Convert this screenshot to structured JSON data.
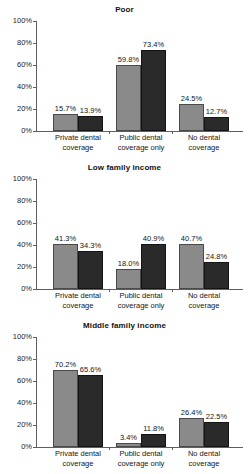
{
  "figure": {
    "bar_colors": {
      "light": "#8a8a8a",
      "dark": "#2a2a2a"
    },
    "axis_color": "#5f5f5f"
  },
  "y_axis": {
    "ticks": [
      "100%",
      "80%",
      "60%",
      "40%",
      "20%",
      "0%"
    ],
    "values": [
      100,
      80,
      60,
      40,
      20,
      0
    ],
    "min": 0,
    "max": 100
  },
  "categories": [
    "Private dental\ncoverage",
    "Public dental\ncoverage only",
    "No dental\ncoverage"
  ],
  "panels": [
    {
      "title": "Poor",
      "labels": [
        "15.7%",
        "13.9%",
        "59.8%",
        "73.4%",
        "24.5%",
        "12.7%"
      ]
    },
    {
      "title": "Low family income",
      "labels": [
        "41.3%",
        "34.3%",
        "18.0%",
        "40.9%",
        "40.7%",
        "24.8%"
      ]
    },
    {
      "title": "Middle family income",
      "labels": [
        "70.2%",
        "65.6%",
        "3.4%",
        "11.8%",
        "26.4%",
        "22.5%"
      ]
    }
  ],
  "chart_data": [
    {
      "type": "bar",
      "title": "Poor",
      "xlabel": "",
      "ylabel": "",
      "ylim": [
        0,
        100
      ],
      "ytick_labels": [
        "0%",
        "20%",
        "40%",
        "60%",
        "80%",
        "100%"
      ],
      "grid": false,
      "legend": "none",
      "categories": [
        "Private dental coverage",
        "Public dental coverage only",
        "No dental coverage"
      ],
      "series": [
        {
          "name": "series-1-light",
          "values": [
            15.7,
            59.8,
            24.5
          ]
        },
        {
          "name": "series-2-dark",
          "values": [
            13.9,
            73.4,
            12.7
          ]
        }
      ]
    },
    {
      "type": "bar",
      "title": "Low family income",
      "xlabel": "",
      "ylabel": "",
      "ylim": [
        0,
        100
      ],
      "ytick_labels": [
        "0%",
        "20%",
        "40%",
        "60%",
        "80%",
        "100%"
      ],
      "grid": false,
      "legend": "none",
      "categories": [
        "Private dental coverage",
        "Public dental coverage only",
        "No dental coverage"
      ],
      "series": [
        {
          "name": "series-1-light",
          "values": [
            41.3,
            18.0,
            40.7
          ]
        },
        {
          "name": "series-2-dark",
          "values": [
            34.3,
            40.9,
            24.8
          ]
        }
      ]
    },
    {
      "type": "bar",
      "title": "Middle family income",
      "xlabel": "",
      "ylabel": "",
      "ylim": [
        0,
        100
      ],
      "ytick_labels": [
        "0%",
        "20%",
        "40%",
        "60%",
        "80%",
        "100%"
      ],
      "grid": false,
      "legend": "none",
      "categories": [
        "Private dental coverage",
        "Public dental coverage only",
        "No dental coverage"
      ],
      "series": [
        {
          "name": "series-1-light",
          "values": [
            70.2,
            3.4,
            26.4
          ]
        },
        {
          "name": "series-2-dark",
          "values": [
            65.6,
            11.8,
            22.5
          ]
        }
      ]
    }
  ]
}
